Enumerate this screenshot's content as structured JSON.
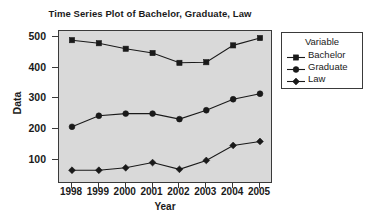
{
  "chart_data": {
    "type": "line",
    "title": "Time Series Plot of Bachelor, Graduate, Law",
    "xlabel": "Year",
    "ylabel": "Data",
    "categories": [
      "1998",
      "1999",
      "2000",
      "2001",
      "2002",
      "2003",
      "2004",
      "2005"
    ],
    "x": [
      1998,
      1999,
      2000,
      2001,
      2002,
      2003,
      2004,
      2005
    ],
    "series": [
      {
        "name": "Bachelor",
        "marker": "square",
        "color": "#1a1a1a",
        "values": [
          490,
          480,
          462,
          448,
          416,
          418,
          473,
          497
        ]
      },
      {
        "name": "Graduate",
        "marker": "circle",
        "color": "#1a1a1a",
        "values": [
          207,
          243,
          250,
          250,
          232,
          261,
          297,
          315
        ]
      },
      {
        "name": "Law",
        "marker": "diamond",
        "color": "#1a1a1a",
        "values": [
          65,
          65,
          73,
          90,
          68,
          97,
          146,
          159
        ]
      }
    ],
    "ylim": [
      20,
      520
    ],
    "yticks": [
      100,
      200,
      300,
      400,
      500
    ],
    "ytick_labels": [
      "100",
      "200",
      "300",
      "400",
      "500"
    ],
    "xlim": [
      1997.6,
      2005.4
    ],
    "grid": false,
    "legend_position": "right",
    "legend_title": "Variable",
    "plot_background": "#d9d9d9",
    "figure_background": "#ffffff",
    "frame_color": "#3a3a3a"
  }
}
